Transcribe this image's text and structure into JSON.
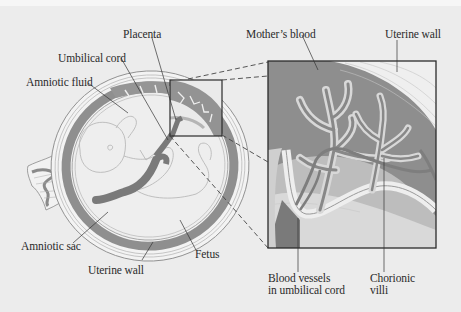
{
  "figure": {
    "type": "anatomical diagram",
    "colors": {
      "background": "#ececec",
      "uterine_wall_light": "#f2f2f2",
      "placenta_dark": "#8d8d8d",
      "blood": "#808080",
      "cord": "#777777",
      "amniotic_fluid": "#eeeeee",
      "inset_mid": "#b4b4b4",
      "outline": "#333333"
    },
    "labels": {
      "placenta": "Placenta",
      "umbilical_cord": "Umbilical cord",
      "amniotic_fluid": "Amniotic fluid",
      "amniotic_sac": "Amniotic sac",
      "uterine_wall_bottom": "Uterine wall",
      "fetus": "Fetus",
      "mothers_blood": "Mother’s blood",
      "uterine_wall_inset": "Uterine wall",
      "blood_vessels_line1": "Blood vessels",
      "blood_vessels_line2": "in umbilical cord",
      "chorionic_line1": "Chorionic",
      "chorionic_line2": "villi"
    }
  }
}
